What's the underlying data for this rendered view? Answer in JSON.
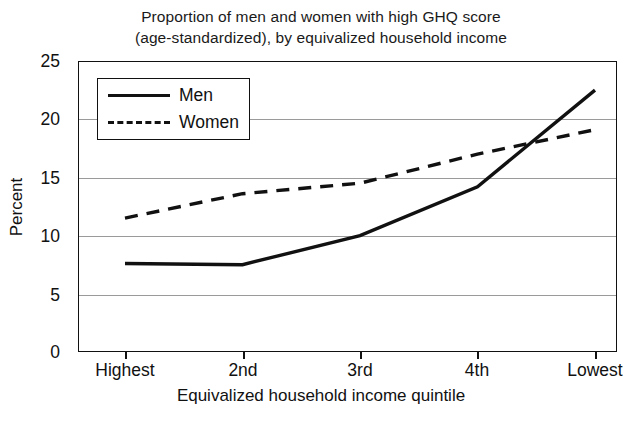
{
  "chart_data": {
    "type": "line",
    "title": "Proportion of men and women with high GHQ score (age-standardized), by equivalized household income",
    "title_line1": "Proportion of men and women with high GHQ score",
    "title_line2": "(age-standardized), by equivalized household income",
    "xlabel": "Equivalized household income quintile",
    "ylabel": "Percent",
    "categories": [
      "Highest",
      "2nd",
      "3rd",
      "4th",
      "Lowest"
    ],
    "ylim": [
      0,
      25
    ],
    "yticks": [
      0,
      5,
      10,
      15,
      20,
      25
    ],
    "ytick_labels": [
      "0",
      "5",
      "10",
      "15",
      "20",
      "25"
    ],
    "grid": "horizontal",
    "legend_position": "upper-left-inside",
    "series": [
      {
        "name": "Men",
        "style": "solid",
        "color": "#111111",
        "values": [
          7.6,
          7.5,
          10.0,
          14.2,
          22.5
        ]
      },
      {
        "name": "Women",
        "style": "dashed",
        "color": "#111111",
        "values": [
          11.5,
          13.6,
          14.5,
          17.0,
          19.1
        ]
      }
    ]
  },
  "legend": {
    "items": [
      {
        "label": "Men"
      },
      {
        "label": "Women"
      }
    ]
  },
  "axis": {
    "y_label": "Percent",
    "x_label": "Equivalized household income quintile",
    "y_ticks": [
      "25",
      "20",
      "15",
      "10",
      "5",
      "0"
    ],
    "x_ticks": [
      "Highest",
      "2nd",
      "3rd",
      "4th",
      "Lowest"
    ]
  },
  "colors": {
    "line": "#111111",
    "grid": "#9a9a9a",
    "frame": "#111111",
    "background": "#ffffff"
  }
}
